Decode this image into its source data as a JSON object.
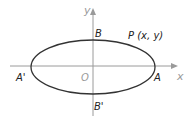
{
  "diagram": {
    "type": "ellipse-on-axes",
    "colors": {
      "axis": "#9a9a9a",
      "ellipse": "#333333",
      "label": "#222222",
      "axis_label": "#9a9a9a",
      "origin_label": "#9a9a9a"
    },
    "axes": {
      "x_label": "x",
      "y_label": "y"
    },
    "origin_label": "O",
    "points": {
      "A": "A",
      "A_prime": "A'",
      "B": "B",
      "B_prime": "B'",
      "P": "P (x, y)"
    }
  }
}
